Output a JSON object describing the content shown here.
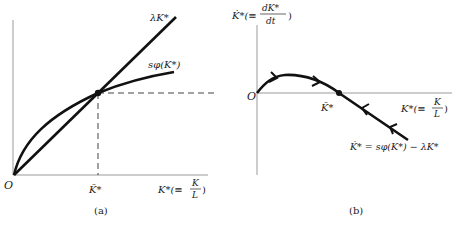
{
  "figure": {
    "panel_a": {
      "caption": "(a)",
      "origin_label": "O",
      "line_label": "λK*",
      "curve_label": "sφ(K*)",
      "equilibrium_label": "K̄*",
      "x_axis_label": {
        "main": "K*(≡",
        "frac_num": "K",
        "frac_den": "L",
        "close": ")"
      }
    },
    "panel_b": {
      "caption": "(b)",
      "origin_label": "O",
      "equilibrium_label": "K̄*",
      "y_axis_label": {
        "main": "K̇*(≡",
        "frac_num": "dK*",
        "frac_den": "dt",
        "close": ")"
      },
      "x_axis_label": {
        "main": "K*(≡",
        "frac_num": "K",
        "frac_den": "L",
        "close": ")"
      },
      "equation_label": "K̇* = sφ(K*) − λK*"
    },
    "colors": {
      "curve": "#111111",
      "axis": "#9a9a9a",
      "dashed": "#444444",
      "text": "#222222"
    }
  }
}
